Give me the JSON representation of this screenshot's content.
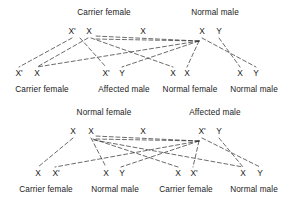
{
  "figure": {
    "type": "genetic-inheritance-cross-diagram",
    "line_style": "dashed",
    "line_color": "#2b2b2b",
    "background": "#ffffff"
  },
  "crosses": [
    {
      "id": "cross-1",
      "parents": [
        {
          "id": "p1-left",
          "title": "Carrier female",
          "alleles": [
            {
              "symbol": "X'",
              "x": 72,
              "y": 31
            },
            {
              "symbol": "X",
              "x": 89,
              "y": 31
            }
          ],
          "title_x": 104,
          "title_y": 13
        },
        {
          "id": "p1-right",
          "title": "Normal male",
          "alleles": [
            {
              "symbol": "X",
              "x": 202,
              "y": 31
            },
            {
              "symbol": "Y",
              "x": 219,
              "y": 31
            }
          ],
          "title_x": 215,
          "title_y": 13
        }
      ],
      "middle_marker": {
        "symbol": "X",
        "x": 143,
        "y": 31
      },
      "offspring": [
        {
          "id": "o1-1",
          "title": "Carrier female",
          "alleles": [
            {
              "symbol": "X'",
              "x": 19,
              "y": 73
            },
            {
              "symbol": "X",
              "x": 36,
              "y": 73
            }
          ],
          "title_x": 42,
          "title_y": 90
        },
        {
          "id": "o1-2",
          "title": "Affected male",
          "alleles": [
            {
              "symbol": "X'",
              "x": 106,
              "y": 73
            },
            {
              "symbol": "Y",
              "x": 122,
              "y": 73
            }
          ],
          "title_x": 124,
          "title_y": 90
        },
        {
          "id": "o1-3",
          "title": "Normal female",
          "alleles": [
            {
              "symbol": "X",
              "x": 173,
              "y": 73
            },
            {
              "symbol": "X",
              "x": 187,
              "y": 73
            }
          ],
          "title_x": 190,
          "title_y": 90
        },
        {
          "id": "o1-4",
          "title": "Normal male",
          "alleles": [
            {
              "symbol": "X",
              "x": 240,
              "y": 73
            },
            {
              "symbol": "Y",
              "x": 256,
              "y": 73
            }
          ],
          "title_x": 254,
          "title_y": 90
        }
      ]
    },
    {
      "id": "cross-2",
      "parents": [
        {
          "id": "p2-left",
          "title": "Normal female",
          "alleles": [
            {
              "symbol": "X",
              "x": 73,
              "y": 31
            },
            {
              "symbol": "X",
              "x": 91,
              "y": 31
            }
          ],
          "title_x": 104,
          "title_y": 13
        },
        {
          "id": "p2-right",
          "title": "Affected male",
          "alleles": [
            {
              "symbol": "X'",
              "x": 202,
              "y": 31
            },
            {
              "symbol": "Y",
              "x": 219,
              "y": 31
            }
          ],
          "title_x": 215,
          "title_y": 13
        }
      ],
      "middle_marker": {
        "symbol": "X",
        "x": 143,
        "y": 31
      },
      "offspring": [
        {
          "id": "o2-1",
          "title": "Carrier female",
          "alleles": [
            {
              "symbol": "X",
              "x": 38,
              "y": 73
            },
            {
              "symbol": "X'",
              "x": 55,
              "y": 73
            }
          ],
          "title_x": 46,
          "title_y": 90
        },
        {
          "id": "o2-2",
          "title": "Normal male",
          "alleles": [
            {
              "symbol": "X",
              "x": 106,
              "y": 73
            },
            {
              "symbol": "Y",
              "x": 121,
              "y": 73
            }
          ],
          "title_x": 115,
          "title_y": 90
        },
        {
          "id": "o2-3",
          "title": "Carrier female",
          "alleles": [
            {
              "symbol": "X",
              "x": 178,
              "y": 73
            },
            {
              "symbol": "X'",
              "x": 193,
              "y": 73
            }
          ],
          "title_x": 186,
          "title_y": 90
        },
        {
          "id": "o2-4",
          "title": "Normal male",
          "alleles": [
            {
              "symbol": "X",
              "x": 243,
              "y": 73
            },
            {
              "symbol": "Y",
              "x": 260,
              "y": 73
            }
          ],
          "title_x": 254,
          "title_y": 90
        }
      ]
    }
  ],
  "edges": {
    "cross1": [
      {
        "from": "X'",
        "to": "X'-carrier-female",
        "x1": 72,
        "y1": 38,
        "x2": 19,
        "y2": 66
      },
      {
        "from": "X",
        "to": "X-carrier-female",
        "x1": 89,
        "y1": 38,
        "x2": 36,
        "y2": 66
      },
      {
        "from": "X'",
        "to": "X'-affected-male",
        "x1": 80,
        "y1": 40,
        "x2": 106,
        "y2": 66
      },
      {
        "from": "X",
        "to": "X-normal-female",
        "x1": 90,
        "y1": 38,
        "x2": 173,
        "y2": 66
      },
      {
        "from": "X-male",
        "to": "X-carrier-female-2",
        "x1": 198,
        "y1": 40,
        "x2": 36,
        "y2": 66
      },
      {
        "from": "X-male",
        "to": "X-normal-female-2",
        "x1": 200,
        "y1": 40,
        "x2": 187,
        "y2": 66
      },
      {
        "from": "Y-male",
        "to": "Y-affected-male",
        "x1": 204,
        "y1": 40,
        "x2": 122,
        "y2": 66
      },
      {
        "from": "Y-male",
        "to": "Y-normal-male",
        "x1": 219,
        "y1": 38,
        "x2": 256,
        "y2": 66
      },
      {
        "from": "X-male",
        "to": "X-normal-male",
        "x1": 206,
        "y1": 40,
        "x2": 240,
        "y2": 66
      }
    ],
    "cross2": [
      {
        "from": "X",
        "to": "X-carrier-female",
        "x1": 73,
        "y1": 38,
        "x2": 38,
        "y2": 66
      },
      {
        "from": "X",
        "to": "X-normal-male",
        "x1": 91,
        "y1": 38,
        "x2": 106,
        "y2": 66
      },
      {
        "from": "X",
        "to": "X-carrier-female-3",
        "x1": 92,
        "y1": 39,
        "x2": 178,
        "y2": 66
      },
      {
        "from": "X",
        "to": "X-normal-male-4",
        "x1": 93,
        "y1": 39,
        "x2": 243,
        "y2": 66
      },
      {
        "from": "X'-male",
        "to": "X'-carrier-female",
        "x1": 198,
        "y1": 40,
        "x2": 55,
        "y2": 66
      },
      {
        "from": "X'-male",
        "to": "X'-carrier-female-3",
        "x1": 200,
        "y1": 40,
        "x2": 193,
        "y2": 66
      },
      {
        "from": "Y-male",
        "to": "Y-normal-male",
        "x1": 204,
        "y1": 40,
        "x2": 121,
        "y2": 66
      },
      {
        "from": "Y-male",
        "to": "Y-normal-male-4",
        "x1": 219,
        "y1": 38,
        "x2": 260,
        "y2": 66
      }
    ]
  }
}
